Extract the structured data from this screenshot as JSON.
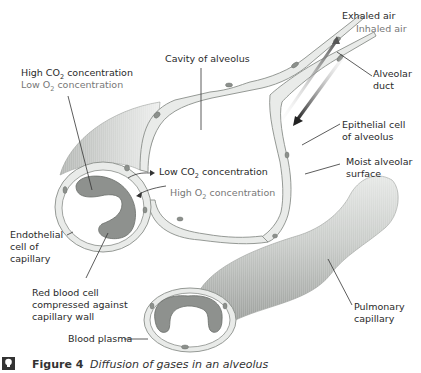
{
  "figure": {
    "number_label": "Figure 4",
    "caption": "Diffusion of gases in an alveolus",
    "icon": "lightbulb-icon"
  },
  "labels": {
    "exhaled_air": "Exhaled air",
    "inhaled_air": "Inhaled air",
    "cavity_of_alveolus": "Cavity of alveolus",
    "alveolar_duct_line1": "Alveolar",
    "alveolar_duct_line2": "duct",
    "high_co2_prefix": "High CO",
    "high_co2_sub": "2",
    "high_co2_suffix": " concentration",
    "low_o2_prefix": "Low O",
    "low_o2_sub": "2",
    "low_o2_suffix": " concentration",
    "low_co2_prefix": "Low CO",
    "low_co2_sub": "2",
    "low_co2_suffix": " concentration",
    "high_o2_prefix": "High O",
    "high_o2_sub": "2",
    "high_o2_suffix": " concentration",
    "epithelial_line1": "Epithelial cell",
    "epithelial_line2": "of alveolus",
    "moist_line1": "Moist alveolar",
    "moist_line2": "surface",
    "endothelial_line1": "Endothelial",
    "endothelial_line2": "cell of",
    "endothelial_line3": "capillary",
    "rbc_line1": "Red blood cell",
    "rbc_line2": "compressed against",
    "rbc_line3": "capillary wall",
    "pulmonary_line1": "Pulmonary",
    "pulmonary_line2": "capillary",
    "blood_plasma": "Blood plasma"
  },
  "colors": {
    "text": "#2a2a2a",
    "light_text": "#777777",
    "capillary_shade": "#a9aca9",
    "red_blood_cell": "#8e918e",
    "wall": "#e9ebe9"
  }
}
